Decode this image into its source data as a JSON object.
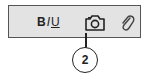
{
  "toolbar": {
    "format": {
      "bold": "B",
      "italic": "I",
      "underline": "U"
    },
    "icons": [
      "camera-icon",
      "paperclip-icon"
    ]
  },
  "callout": {
    "number": "2",
    "target": "camera-icon"
  }
}
